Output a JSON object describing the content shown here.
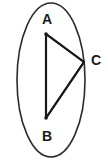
{
  "figure": {
    "kind": "geometry-diagram",
    "background_color": "#ffffff",
    "stroke_color": "#1a1a1a",
    "ellipse_stroke_color": "#2b2b2b",
    "label_color": "#1a1a1a",
    "canvas": {
      "width": 108,
      "height": 162
    }
  },
  "ellipse": {
    "name": "ellipse-outline",
    "cx": 51,
    "cy": 80,
    "rx": 34,
    "ry": 77,
    "stroke_width": 1.6,
    "fill": "none"
  },
  "triangle": {
    "name": "triangle-abc",
    "stroke_width": 2.1,
    "fill": "none",
    "points": "46,34 84,62 46,118",
    "edges": [
      {
        "name": "segment-ab",
        "from": "A",
        "to": "B",
        "x1": 46,
        "y1": 34,
        "x2": 46,
        "y2": 118
      },
      {
        "name": "segment-ac",
        "from": "A",
        "to": "C",
        "x1": 46,
        "y1": 34,
        "x2": 84,
        "y2": 62
      },
      {
        "name": "segment-bc",
        "from": "B",
        "to": "C",
        "x1": 46,
        "y1": 118,
        "x2": 84,
        "y2": 62
      }
    ]
  },
  "vertices": [
    {
      "id": "A",
      "label": "A",
      "point_name": "vertex-point-a",
      "label_name": "vertex-label-a",
      "x": 46,
      "y": 34,
      "dot_radius": 1.8,
      "label_x": 47,
      "label_y": 20,
      "label_font_size": 14
    },
    {
      "id": "B",
      "label": "B",
      "point_name": "vertex-point-b",
      "label_name": "vertex-label-b",
      "x": 46,
      "y": 118,
      "dot_radius": 1.8,
      "label_x": 47,
      "label_y": 137,
      "label_font_size": 14
    },
    {
      "id": "C",
      "label": "C",
      "point_name": "vertex-point-c",
      "label_name": "vertex-label-c",
      "x": 84,
      "y": 62,
      "dot_radius": 0,
      "label_x": 96,
      "label_y": 61,
      "label_font_size": 14
    }
  ]
}
